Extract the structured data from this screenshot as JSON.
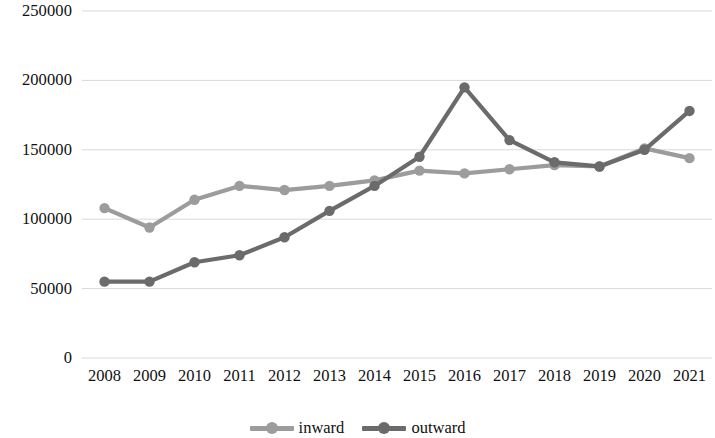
{
  "chart_data": {
    "type": "line",
    "title": "",
    "subtitle": "",
    "xlabel": "",
    "ylabel": "",
    "categories": [
      "2008",
      "2009",
      "2010",
      "2011",
      "2012",
      "2013",
      "2014",
      "2015",
      "2016",
      "2017",
      "2018",
      "2019",
      "2020",
      "2021"
    ],
    "ylim": [
      0,
      250000
    ],
    "ytick_labels": [
      "0",
      "50000",
      "100000",
      "150000",
      "200000",
      "250000"
    ],
    "ytick_values": [
      0,
      50000,
      100000,
      150000,
      200000,
      250000
    ],
    "grid": true,
    "grid_axis": "y",
    "legend_position": "bottom",
    "series": [
      {
        "name": "inward",
        "color": "#9c9c9c",
        "values": [
          108000,
          94000,
          114000,
          124000,
          121000,
          124000,
          128000,
          135000,
          133000,
          136000,
          139000,
          138000,
          151000,
          144000
        ]
      },
      {
        "name": "outward",
        "color": "#6b6b6b",
        "values": [
          55000,
          55000,
          69000,
          74000,
          87000,
          106000,
          124000,
          145000,
          195000,
          157000,
          141000,
          138000,
          150000,
          178000
        ]
      }
    ]
  },
  "legend": {
    "items": [
      {
        "label": "inward"
      },
      {
        "label": "outward"
      }
    ]
  },
  "colors": {
    "inward": "#9c9c9c",
    "outward": "#6b6b6b",
    "gridline": "#d9d9d9",
    "text": "#101010",
    "background": "#ffffff"
  }
}
